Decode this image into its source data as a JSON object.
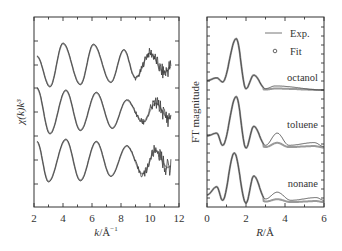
{
  "chart_data": [
    {
      "type": "line",
      "panel": "left",
      "title": "",
      "xlabel": "k/Å⁻¹",
      "ylabel": "χ(k)k³",
      "xlim": [
        2,
        12
      ],
      "xticks": [
        "2",
        "4",
        "6",
        "8",
        "10",
        "12"
      ],
      "yticks_labeled": false,
      "grid": false,
      "legend": null,
      "series": [
        {
          "name": "top (octanol)",
          "offset_px": 65,
          "extrema": [
            {
              "k": 2.2,
              "y": 0.4
            },
            {
              "k": 3.1,
              "y": -1.0
            },
            {
              "k": 4.0,
              "y": 1.0
            },
            {
              "k": 5.2,
              "y": -0.9
            },
            {
              "k": 6.1,
              "y": 0.95
            },
            {
              "k": 7.3,
              "y": -0.8
            },
            {
              "k": 8.2,
              "y": 0.7
            },
            {
              "k": 9.0,
              "y": -0.6
            },
            {
              "k": 10.0,
              "y": 0.55
            },
            {
              "k": 11.0,
              "y": -0.35
            },
            {
              "k": 11.4,
              "y": -0.1
            }
          ]
        },
        {
          "name": "middle (toluene)",
          "offset_px": 112,
          "extrema": [
            {
              "k": 2.2,
              "y": 1.1
            },
            {
              "k": 3.1,
              "y": -1.0
            },
            {
              "k": 4.2,
              "y": 1.0
            },
            {
              "k": 5.2,
              "y": -0.85
            },
            {
              "k": 6.3,
              "y": 0.9
            },
            {
              "k": 7.4,
              "y": -0.75
            },
            {
              "k": 8.4,
              "y": 0.55
            },
            {
              "k": 9.5,
              "y": -0.45
            },
            {
              "k": 10.4,
              "y": 0.4
            },
            {
              "k": 11.3,
              "y": -0.3
            },
            {
              "k": 11.4,
              "y": -0.2
            }
          ]
        },
        {
          "name": "bottom (nonane)",
          "offset_px": 160,
          "extrema": [
            {
              "k": 2.2,
              "y": 0.85
            },
            {
              "k": 3.0,
              "y": -1.0
            },
            {
              "k": 4.2,
              "y": 0.95
            },
            {
              "k": 5.2,
              "y": -0.95
            },
            {
              "k": 6.3,
              "y": 0.85
            },
            {
              "k": 7.3,
              "y": -0.75
            },
            {
              "k": 8.4,
              "y": 0.65
            },
            {
              "k": 9.5,
              "y": -0.65
            },
            {
              "k": 10.4,
              "y": 0.45
            },
            {
              "k": 11.2,
              "y": -0.35
            },
            {
              "k": 11.4,
              "y": -0.3
            }
          ]
        }
      ]
    },
    {
      "type": "line",
      "panel": "right",
      "title": "",
      "xlabel": "R/Å",
      "ylabel": "FT magnitude",
      "xlim": [
        0,
        6
      ],
      "xticks": [
        "0",
        "2",
        "4",
        "6"
      ],
      "yticks_labeled": false,
      "grid": false,
      "legend": {
        "position": "upper right",
        "entries": [
          {
            "label": "Exp.",
            "marker": "line"
          },
          {
            "label": "Fit",
            "marker": "circle"
          }
        ]
      },
      "series": [
        {
          "name": "octanol",
          "peaks": [
            {
              "R": 0.0,
              "h": 0.35
            },
            {
              "R": 0.5,
              "h": 0.45
            },
            {
              "R": 0.8,
              "h": 0.3
            },
            {
              "R": 1.5,
              "h": 1.9
            },
            {
              "R": 2.0,
              "h": 0.05
            },
            {
              "R": 2.4,
              "h": 0.55
            },
            {
              "R": 3.0,
              "h": 0.05
            },
            {
              "R": 3.5,
              "h": 0.15
            },
            {
              "R": 6.0,
              "h": 0.0
            }
          ]
        },
        {
          "name": "toluene",
          "peaks": [
            {
              "R": 0.0,
              "h": 0.45
            },
            {
              "R": 0.5,
              "h": 0.55
            },
            {
              "R": 0.8,
              "h": 0.1
            },
            {
              "R": 1.5,
              "h": 1.9
            },
            {
              "R": 2.0,
              "h": 0.0
            },
            {
              "R": 2.4,
              "h": 0.8
            },
            {
              "R": 3.0,
              "h": 0.1
            },
            {
              "R": 3.6,
              "h": 0.55
            },
            {
              "R": 4.2,
              "h": 0.1
            },
            {
              "R": 5.5,
              "h": 0.2
            },
            {
              "R": 6.0,
              "h": 0.05
            }
          ]
        },
        {
          "name": "nonane",
          "peaks": [
            {
              "R": 0.0,
              "h": 0.3
            },
            {
              "R": 0.5,
              "h": 0.6
            },
            {
              "R": 0.8,
              "h": 0.1
            },
            {
              "R": 1.4,
              "h": 1.85
            },
            {
              "R": 2.0,
              "h": 0.0
            },
            {
              "R": 2.4,
              "h": 1.0
            },
            {
              "R": 3.0,
              "h": 0.15
            },
            {
              "R": 3.6,
              "h": 0.4
            },
            {
              "R": 4.3,
              "h": 0.1
            },
            {
              "R": 5.6,
              "h": 0.2
            },
            {
              "R": 6.0,
              "h": 0.1
            }
          ]
        }
      ],
      "annotations": [
        "octanol",
        "toluene",
        "nonane"
      ]
    }
  ],
  "left": {
    "xlabel_k": "k",
    "xlabel_unit": "/Å",
    "xlabel_sup": "−1",
    "ylabel": "χ(k)k³",
    "xticks": [
      "2",
      "4",
      "6",
      "8",
      "10",
      "12"
    ]
  },
  "right": {
    "xlabel_R": "R",
    "xlabel_unit": "/Å",
    "ylabel": "FT magnitude",
    "xticks": [
      "0",
      "2",
      "4",
      "6"
    ],
    "legend_exp": "Exp.",
    "legend_fit": "Fit",
    "label_octanol": "octanol",
    "label_toluene": "toluene",
    "label_nonane": "nonane"
  },
  "colors": {
    "axis": "#333333",
    "exp_line": "#3a3a3a",
    "fit_line": "#9a9a9a"
  }
}
